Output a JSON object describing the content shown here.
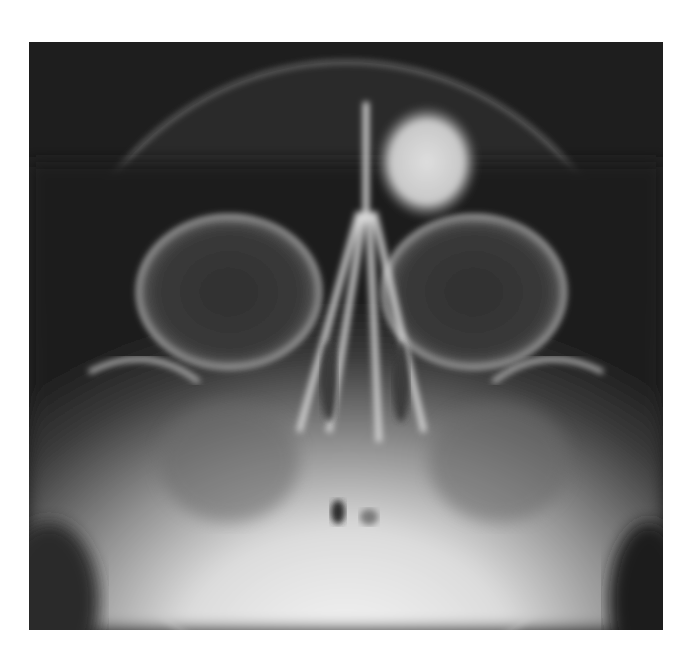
{
  "image": {
    "subject": "skull radiograph, occipitomental (Waters) view",
    "description": "Frontal sinus region with a rounded radiopaque mass above the left orbit; orbits, nasal septum, maxillary sinuses visible",
    "colors": {
      "background": "#ffffff",
      "film_dark": "#1e1e1e",
      "bone_mid": "#8a8a8a",
      "bone_bright": "#e8e8e8",
      "lesion": "#d4d4d4"
    }
  }
}
